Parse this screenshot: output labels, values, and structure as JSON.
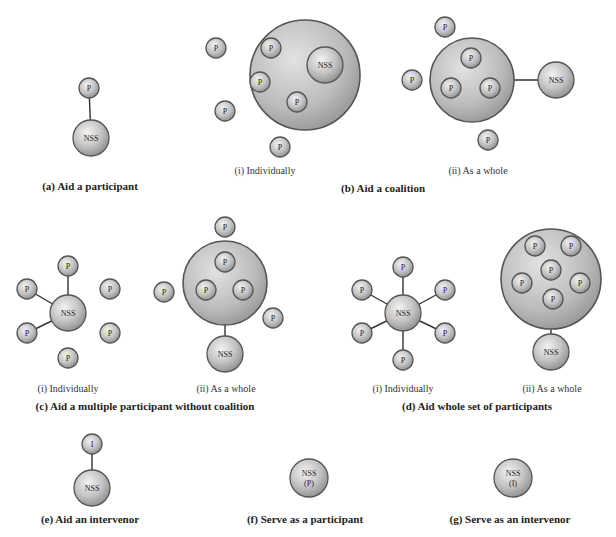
{
  "figure": {
    "colors": {
      "sphere_light": "#eeeeee",
      "sphere_mid": "#bdbdbd",
      "sphere_dark": "#8a8a8a",
      "outline": "#555555",
      "edge": "#333333",
      "text": "#222222"
    },
    "panels": [
      {
        "id": "a",
        "caption": "(a) Aid a participant",
        "caption_pos": [
          90,
          180
        ],
        "nodes": [
          {
            "label": "P",
            "x": 89,
            "y": 88,
            "r": 10
          },
          {
            "label": "NSS",
            "x": 91,
            "y": 138,
            "r": 18
          }
        ],
        "edges": [
          [
            0,
            1
          ]
        ]
      },
      {
        "id": "b-i",
        "subcaption": "(i) Individually",
        "subcaption_pos": [
          265,
          165
        ],
        "groups": [
          {
            "x": 305,
            "y": 75,
            "r": 55
          }
        ],
        "nodes": [
          {
            "label": "P",
            "x": 271,
            "y": 48,
            "r": 10
          },
          {
            "label": "NSS",
            "x": 325,
            "y": 65,
            "r": 18
          },
          {
            "label": "P",
            "x": 260,
            "y": 82,
            "r": 10
          },
          {
            "label": "P",
            "x": 297,
            "y": 102,
            "r": 10
          },
          {
            "label": "P",
            "x": 216,
            "y": 48,
            "r": 10
          },
          {
            "label": "P",
            "x": 225,
            "y": 111,
            "r": 10
          },
          {
            "label": "P",
            "x": 280,
            "y": 147,
            "r": 10
          }
        ],
        "edges": [
          [
            0,
            1
          ],
          [
            2,
            1
          ],
          [
            3,
            1
          ]
        ]
      },
      {
        "id": "b-ii",
        "subcaption": "(ii) As a whole",
        "subcaption_pos": [
          478,
          165
        ],
        "groups": [
          {
            "x": 472,
            "y": 80,
            "r": 42
          }
        ],
        "nodes": [
          {
            "label": "P",
            "x": 471,
            "y": 58,
            "r": 10
          },
          {
            "label": "P",
            "x": 451,
            "y": 88,
            "r": 10
          },
          {
            "label": "P",
            "x": 490,
            "y": 88,
            "r": 10
          },
          {
            "label": "NSS",
            "x": 556,
            "y": 80,
            "r": 18
          },
          {
            "label": "P",
            "x": 445,
            "y": 27,
            "r": 10
          },
          {
            "label": "P",
            "x": 412,
            "y": 80,
            "r": 10
          },
          {
            "label": "P",
            "x": 488,
            "y": 140,
            "r": 10
          }
        ],
        "edges": [
          [
            "group0",
            3
          ]
        ]
      },
      {
        "id": "b",
        "caption": "(b) Aid a coalition",
        "caption_pos": [
          383,
          182
        ]
      },
      {
        "id": "c-i",
        "subcaption": "(i) Individually",
        "subcaption_pos": [
          68,
          383
        ],
        "nodes": [
          {
            "label": "NSS",
            "x": 68,
            "y": 313,
            "r": 18
          },
          {
            "label": "P",
            "x": 68,
            "y": 266,
            "r": 10
          },
          {
            "label": "P",
            "x": 27,
            "y": 289,
            "r": 10
          },
          {
            "label": "P",
            "x": 110,
            "y": 289,
            "r": 10
          },
          {
            "label": "P",
            "x": 27,
            "y": 333,
            "r": 10
          },
          {
            "label": "P",
            "x": 110,
            "y": 333,
            "r": 10
          },
          {
            "label": "P",
            "x": 68,
            "y": 358,
            "r": 10
          }
        ],
        "edges": [
          [
            1,
            0
          ],
          [
            2,
            0
          ],
          [
            4,
            0
          ]
        ]
      },
      {
        "id": "c-ii",
        "subcaption": "(ii) As a whole",
        "subcaption_pos": [
          226,
          383
        ],
        "groups": [
          {
            "x": 225,
            "y": 283,
            "r": 42
          }
        ],
        "nodes": [
          {
            "label": "P",
            "x": 225,
            "y": 262,
            "r": 10
          },
          {
            "label": "P",
            "x": 206,
            "y": 290,
            "r": 10
          },
          {
            "label": "P",
            "x": 243,
            "y": 290,
            "r": 10
          },
          {
            "label": "NSS",
            "x": 225,
            "y": 354,
            "r": 18
          },
          {
            "label": "P",
            "x": 225,
            "y": 227,
            "r": 10
          },
          {
            "label": "P",
            "x": 164,
            "y": 292,
            "r": 10
          },
          {
            "label": "P",
            "x": 273,
            "y": 318,
            "r": 10
          }
        ],
        "edges": [
          [
            "group0",
            3
          ]
        ]
      },
      {
        "id": "c",
        "caption": "(c) Aid a multiple participant without coalition",
        "caption_pos": [
          145,
          400
        ]
      },
      {
        "id": "d-i",
        "subcaption": "(i) Individually",
        "subcaption_pos": [
          403,
          383
        ],
        "nodes": [
          {
            "label": "NSS",
            "x": 403,
            "y": 313,
            "r": 18
          },
          {
            "label": "P",
            "x": 403,
            "y": 267,
            "r": 10
          },
          {
            "label": "P",
            "x": 362,
            "y": 290,
            "r": 10
          },
          {
            "label": "P",
            "x": 445,
            "y": 290,
            "r": 10
          },
          {
            "label": "P",
            "x": 362,
            "y": 333,
            "r": 10
          },
          {
            "label": "P",
            "x": 445,
            "y": 333,
            "r": 10
          },
          {
            "label": "P",
            "x": 403,
            "y": 360,
            "r": 10
          }
        ],
        "edges": [
          [
            1,
            0
          ],
          [
            2,
            0
          ],
          [
            3,
            0
          ],
          [
            4,
            0
          ],
          [
            5,
            0
          ],
          [
            6,
            0
          ]
        ]
      },
      {
        "id": "d-ii",
        "subcaption": "(ii) As a whole",
        "subcaption_pos": [
          552,
          383
        ],
        "groups": [
          {
            "x": 551,
            "y": 279,
            "r": 50
          }
        ],
        "nodes": [
          {
            "label": "P",
            "x": 535,
            "y": 246,
            "r": 10
          },
          {
            "label": "P",
            "x": 571,
            "y": 246,
            "r": 10
          },
          {
            "label": "P",
            "x": 551,
            "y": 270,
            "r": 10
          },
          {
            "label": "P",
            "x": 522,
            "y": 283,
            "r": 10
          },
          {
            "label": "P",
            "x": 580,
            "y": 283,
            "r": 10
          },
          {
            "label": "P",
            "x": 553,
            "y": 299,
            "r": 10
          },
          {
            "label": "NSS",
            "x": 551,
            "y": 352,
            "r": 18
          }
        ],
        "edges": [
          [
            "group0",
            6
          ]
        ]
      },
      {
        "id": "d",
        "caption": "(d) Aid whole set of participants",
        "caption_pos": [
          477,
          400
        ]
      },
      {
        "id": "e",
        "caption": "(e) Aid an intervenor",
        "caption_pos": [
          90,
          513
        ],
        "nodes": [
          {
            "label": "I",
            "x": 92,
            "y": 444,
            "r": 10
          },
          {
            "label": "NSS",
            "x": 92,
            "y": 488,
            "r": 18
          }
        ],
        "edges": [
          [
            0,
            1
          ]
        ]
      },
      {
        "id": "f",
        "caption": "(f) Serve as a participant",
        "caption_pos": [
          305,
          513
        ],
        "nodes": [
          {
            "label": "NSS",
            "sublabel": "(P)",
            "x": 309,
            "y": 478,
            "r": 19
          }
        ],
        "edges": []
      },
      {
        "id": "g",
        "caption": "(g) Serve as an intervenor",
        "caption_pos": [
          510,
          513
        ],
        "nodes": [
          {
            "label": "NSS",
            "sublabel": "(I)",
            "x": 513,
            "y": 478,
            "r": 19
          }
        ],
        "edges": []
      }
    ]
  }
}
